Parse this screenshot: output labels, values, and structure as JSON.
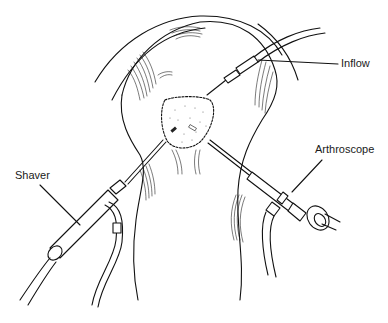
{
  "figure": {
    "labels": {
      "inflow": "Inflow",
      "shaver": "Shaver",
      "arthroscope": "Arthroscope"
    },
    "colors": {
      "line": "#111111",
      "background": "#ffffff"
    }
  }
}
